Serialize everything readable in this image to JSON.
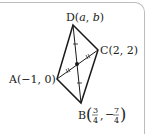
{
  "figure": {
    "type": "parallelogram",
    "points": {
      "A": {
        "label": "A",
        "coords": "(−1, 0)"
      },
      "B": {
        "label": "B",
        "x_num": "3",
        "x_den": "4",
        "y_sign": "−",
        "y_num": "7",
        "y_den": "4"
      },
      "C": {
        "label": "C",
        "coords": "(2, 2)"
      },
      "D": {
        "label": "D",
        "var_a": "a",
        "var_b": "b"
      }
    },
    "diagonals": [
      "AC",
      "BD"
    ],
    "midpoint_marks": {
      "AC": "double-tick",
      "BD": "single-tick"
    },
    "stroke_color": "#1a1a1a",
    "frame_color": "#bdbdbd"
  }
}
